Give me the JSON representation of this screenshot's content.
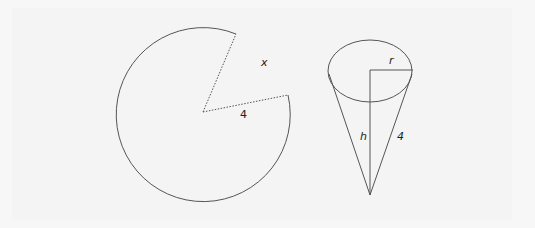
{
  "figure": {
    "sector": {
      "center": [
        203,
        112
      ],
      "radius": 87,
      "cut_points": [
        [
          236,
          34
        ],
        [
          288,
          95
        ]
      ],
      "labels": {
        "arc_gap": "x",
        "radius": "4"
      }
    },
    "cone": {
      "ellipse": {
        "cx": 370,
        "cy": 71,
        "rx": 42,
        "ry": 31
      },
      "apex": [
        370,
        195
      ],
      "labels": {
        "radius": "r",
        "height": "h",
        "slant": "4"
      }
    },
    "colors": {
      "stroke": "#555555",
      "background": "#f4f4f4"
    }
  }
}
